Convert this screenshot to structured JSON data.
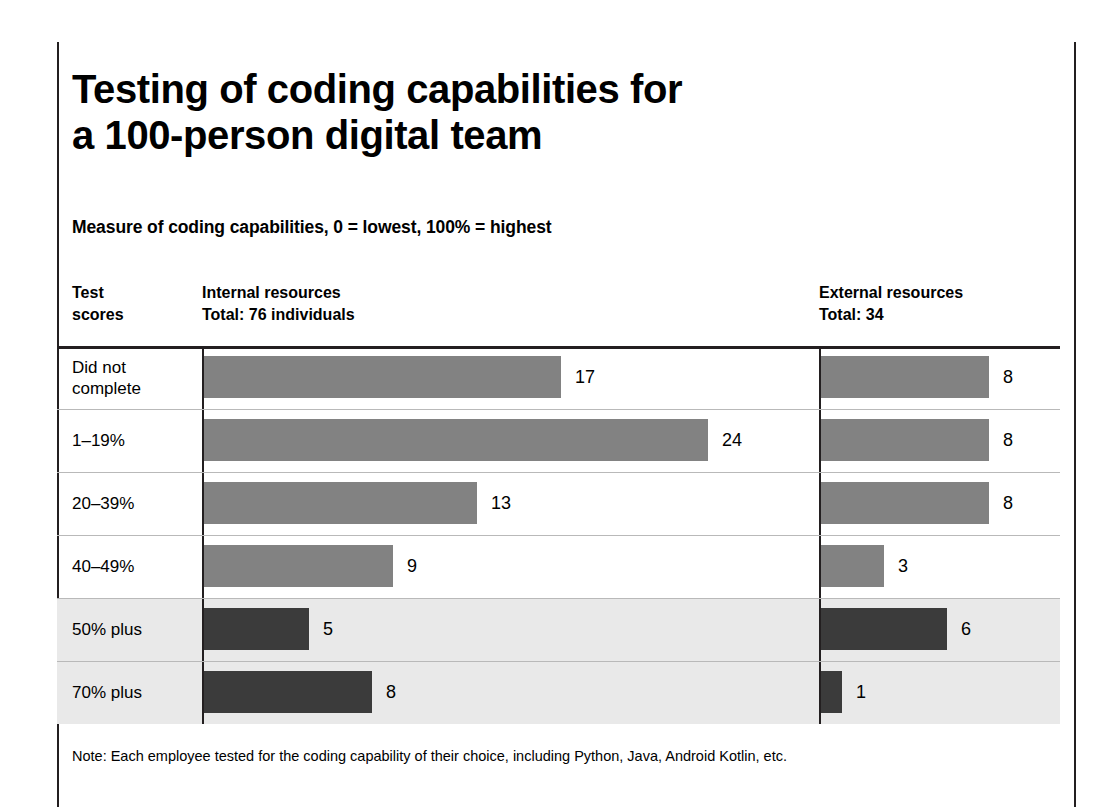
{
  "headline": {
    "line1": "Testing of coding capabilities for",
    "line2": "a 100-person digital team"
  },
  "subtitle": "Measure of coding capabilities, 0 = lowest, 100% = highest",
  "columns": {
    "scores": {
      "line1": "Test",
      "line2": "scores"
    },
    "internal": {
      "line1": "Internal resources",
      "line2": "Total: 76 individuals"
    },
    "external": {
      "line1": "External resources",
      "line2": "Total: 34"
    }
  },
  "note": "Note: Each employee tested for the coding capability of their choice, including Python, Java, Android Kotlin, etc.",
  "colors": {
    "bar_light": "#828282",
    "bar_dark": "#3b3b3b",
    "band": "#e9e9e9",
    "rule": "#231f20"
  },
  "chart_data": {
    "type": "bar",
    "title": "Testing of coding capabilities for a 100-person digital team",
    "subtitle": "Measure of coding capabilities, 0 = lowest, 100% = highest",
    "orientation": "horizontal",
    "xlabel": "",
    "ylabel": "Test scores",
    "grid": false,
    "legend": "none",
    "xlim": [
      0,
      24
    ],
    "categories": [
      "Did not complete",
      "1–19%",
      "20–39%",
      "40–49%",
      "50% plus",
      "70% plus"
    ],
    "category_lines": [
      [
        "Did not",
        "complete"
      ],
      [
        "1–19%",
        ""
      ],
      [
        "20–39%",
        ""
      ],
      [
        "40–49%",
        ""
      ],
      [
        "50% plus",
        ""
      ],
      [
        "70% plus",
        ""
      ]
    ],
    "series": [
      {
        "name": "Internal resources",
        "total": 76,
        "values": [
          17,
          24,
          13,
          9,
          5,
          8
        ],
        "shades": [
          "light",
          "light",
          "light",
          "light",
          "dark",
          "dark"
        ]
      },
      {
        "name": "External resources",
        "total": 34,
        "values": [
          8,
          8,
          8,
          3,
          6,
          1
        ],
        "shades": [
          "light",
          "light",
          "light",
          "light",
          "dark",
          "dark"
        ]
      }
    ],
    "highlighted_categories": [
      "50% plus",
      "70% plus"
    ],
    "annotations": "Note: Each employee tested for the coding capability of their choice, including Python, Java, Android Kotlin, etc."
  }
}
